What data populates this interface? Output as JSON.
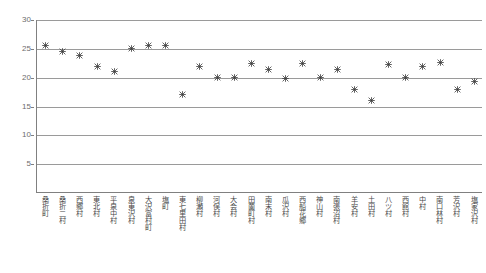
{
  "chart_data": {
    "type": "scatter",
    "title": "",
    "xlabel": "",
    "ylabel": "",
    "ylim": [
      0,
      30
    ],
    "yticks": [
      0,
      5,
      10,
      15,
      20,
      25,
      30
    ],
    "ytick_labels": [
      "0",
      "5",
      "10",
      "15",
      "20",
      "25",
      "30"
    ],
    "grid": true,
    "legend": "none",
    "categories": [
      "桑折町",
      "桑折二村",
      "西郷村",
      "東北村",
      "平泉中村",
      "泉東沢村",
      "大沢富村町",
      "塩町",
      "東七里田村",
      "柳瀬村",
      "河俣村",
      "大会村",
      "田薗町村",
      "南末村",
      "瓜沢村",
      "西船花郷",
      "神山村",
      "南張沼村",
      "羊安村",
      "土田村",
      "八ツ村",
      "西館村",
      "中村",
      "南口林村",
      "芳沢村",
      "塩家沢村"
    ],
    "values": [
      25.5,
      24.6,
      23.9,
      22.0,
      21.0,
      25.0,
      25.6,
      25.6,
      17.0,
      22.0,
      20.0,
      20.0,
      22.5,
      21.4,
      19.8,
      22.5,
      20.0,
      21.5,
      18.0,
      16.0,
      22.2,
      20.0,
      21.9,
      22.7,
      17.9,
      19.4
    ]
  }
}
